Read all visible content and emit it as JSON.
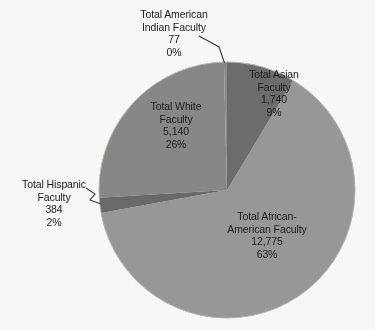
{
  "chart_data": {
    "type": "pie",
    "title": "",
    "subtitle": "",
    "xlabel": "",
    "ylabel": "",
    "legend_position": "none",
    "grid": false,
    "total": 20116,
    "labels_include_value_and_percent": true,
    "categories": [
      "Total Asian Faculty",
      "Total African-American Faculty",
      "Total Hispanic Faculty",
      "Total White Faculty",
      "Total American Indian Faculty"
    ],
    "values": [
      1740,
      12775,
      384,
      5140,
      77
    ],
    "percent_labels": [
      "9%",
      "63%",
      "2%",
      "26%",
      "0%"
    ],
    "value_labels": [
      "1,740",
      "12,775",
      "384",
      "5,140",
      "77"
    ],
    "colors": [
      "#6f6f6f",
      "#9b9b9b",
      "#6b6b6b",
      "#8a8a8a",
      "#8f8f8f"
    ],
    "slices": [
      {
        "name": "asian",
        "value": 1740,
        "percent": "9%",
        "value_label": "1,740",
        "color": "#6f6f6f",
        "start_deg": 0,
        "end_deg": 31.1
      },
      {
        "name": "african",
        "value": 12775,
        "percent": "63%",
        "value_label": "12,775",
        "color": "#9b9b9b",
        "start_deg": 31.1,
        "end_deg": 259.6
      },
      {
        "name": "hispanic",
        "value": 384,
        "percent": "2%",
        "value_label": "384",
        "color": "#6b6b6b",
        "start_deg": 259.6,
        "end_deg": 266.5
      },
      {
        "name": "white",
        "value": 5140,
        "percent": "26%",
        "value_label": "5,140",
        "color": "#8a8a8a",
        "start_deg": 266.5,
        "end_deg": 358.6
      },
      {
        "name": "indian",
        "value": 77,
        "percent": "0%",
        "value_label": "77",
        "color": "#8f8f8f",
        "start_deg": 358.6,
        "end_deg": 360
      }
    ]
  },
  "labels": {
    "american_indian": {
      "line1": "Total American",
      "line2": "Indian Faculty",
      "value": "77",
      "percent": "0%"
    },
    "asian": {
      "line1": "Total Asian",
      "line2": "Faculty",
      "value": "1,740",
      "percent": "9%"
    },
    "white": {
      "line1": "Total White",
      "line2": "Faculty",
      "value": "5,140",
      "percent": "26%"
    },
    "hispanic": {
      "line1": "Total Hispanic",
      "line2": "Faculty",
      "value": "384",
      "percent": "2%"
    },
    "african_american": {
      "line1": "Total African-",
      "line2": "American Faculty",
      "value": "12,775",
      "percent": "63%"
    }
  }
}
